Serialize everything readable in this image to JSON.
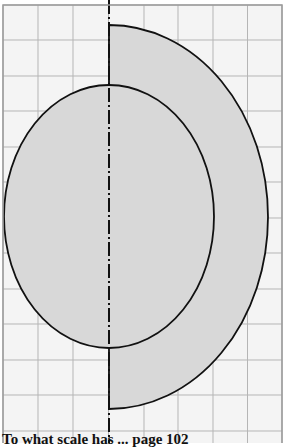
{
  "figure": {
    "background": "#f4f4f4",
    "grid_color": "#b5b5b5",
    "border_color": "#9a9a9a",
    "fill_color": "#d8d8d8",
    "stroke_color": "#111111",
    "axis_color": "#111111",
    "grid": {
      "x0": 3,
      "y0": 5,
      "x1": 282,
      "y1": 446,
      "cols": 8,
      "rows": 12.5,
      "v_lines": [
        3,
        38,
        73,
        108.5,
        144,
        178,
        213,
        247.5,
        282
      ],
      "h_lines": [
        5,
        40,
        76,
        111,
        147,
        182,
        218,
        253,
        289,
        324,
        360,
        395,
        431
      ]
    },
    "axis": {
      "x": 109,
      "y_top": 0,
      "y_bottom": 443,
      "style": "dash-dot"
    },
    "half_ellipse": {
      "cx": 109,
      "cy": 217,
      "rx": 159,
      "ry": 192,
      "side": "right"
    },
    "ellipse": {
      "cx": 109,
      "cy": 216.5,
      "rx": 105,
      "ry": 131.5
    }
  },
  "caption": {
    "text": "To what scale has ... page 102"
  }
}
